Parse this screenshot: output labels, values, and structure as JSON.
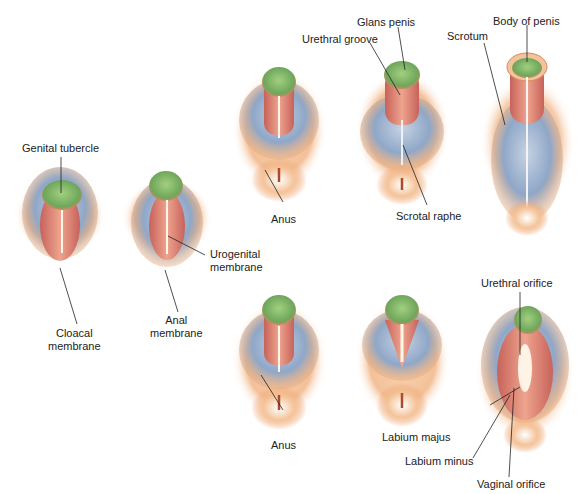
{
  "figure": {
    "stages": [
      {
        "id": "indifferent-1",
        "labels": [
          "Genital tubercle",
          "Cloacal membrane"
        ]
      },
      {
        "id": "indifferent-2",
        "labels": [
          "Urogenital membrane",
          "Anal membrane"
        ]
      },
      {
        "id": "male-1",
        "labels": [
          "Anus"
        ]
      },
      {
        "id": "male-2",
        "labels": [
          "Glans penis",
          "Urethral groove",
          "Scrotal raphe"
        ]
      },
      {
        "id": "male-3",
        "labels": [
          "Body of penis",
          "Scrotum"
        ]
      },
      {
        "id": "female-1",
        "labels": [
          "Anus"
        ]
      },
      {
        "id": "female-2",
        "labels": []
      },
      {
        "id": "female-3",
        "labels": [
          "Urethral orifice",
          "Labium majus",
          "Labium minus",
          "Vaginal orifice"
        ]
      }
    ]
  },
  "labels": {
    "genital_tubercle": "Genital tubercle",
    "cloacal_membrane_1": "Cloacal",
    "cloacal_membrane_2": "membrane",
    "urogenital_membrane_1": "Urogenital",
    "urogenital_membrane_2": "membrane",
    "anal_membrane_1": "Anal",
    "anal_membrane_2": "membrane",
    "anus_male": "Anus",
    "glans_penis": "Glans penis",
    "urethral_groove": "Urethral groove",
    "scrotal_raphe": "Scrotal raphe",
    "scrotum": "Scrotum",
    "body_of_penis": "Body of penis",
    "anus_female": "Anus",
    "urethral_orifice": "Urethral orifice",
    "labium_majus": "Labium majus",
    "labium_minus": "Labium minus",
    "vaginal_orifice": "Vaginal orifice"
  },
  "colors": {
    "tubercle_green": "#7fb86a",
    "fold_red": "#d9806a",
    "swelling_blue": "#98aecb",
    "skin_orange": "#f0b27a",
    "leader_line": "#222222"
  }
}
